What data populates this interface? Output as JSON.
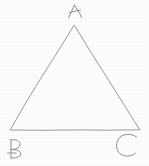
{
  "document": {
    "kind": "hand-drawn-geometry-sketch",
    "title": "Triangle ABC",
    "width": 149,
    "height": 166
  },
  "colors": {
    "background": "#fdfdfc",
    "stroke": "#9a9a9a",
    "stroke_light": "#b4b4b4",
    "label_ink": "#8e8e8e",
    "interior_fill": "#fcfcfb"
  },
  "figure": {
    "shape_name": "triangle",
    "vertex_count": 3,
    "vertices": [
      {
        "label": "A",
        "x": 74,
        "y": 25,
        "position": "apex-top"
      },
      {
        "label": "B",
        "x": 10,
        "y": 130,
        "position": "bottom-left"
      },
      {
        "label": "C",
        "x": 140,
        "y": 130,
        "position": "bottom-right"
      }
    ],
    "edges": [
      {
        "name": "AB",
        "from": "A",
        "to": "B"
      },
      {
        "name": "BC",
        "from": "B",
        "to": "C"
      },
      {
        "name": "CA",
        "from": "C",
        "to": "A"
      }
    ]
  },
  "labels": {
    "apex": {
      "text": "A",
      "x": 67,
      "y": 2,
      "width": 18,
      "height": 18
    },
    "bottom_left": {
      "text": "B",
      "x": 5,
      "y": 134,
      "width": 22,
      "height": 30
    },
    "bottom_right": {
      "text": "C",
      "x": 114,
      "y": 130,
      "width": 26,
      "height": 28
    }
  }
}
